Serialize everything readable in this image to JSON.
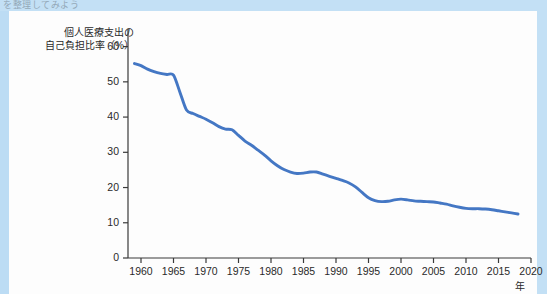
{
  "top_caption": "を整理してみよう",
  "figure": {
    "background_color": "#bcdcf4",
    "card_color": "#fdfdfd",
    "line_color": "#4477c4",
    "axis_color": "#3a3a3a",
    "text_color": "#2a2a2a"
  },
  "chart_data": {
    "type": "line",
    "title": "",
    "subtitle": "",
    "xlabel": "年",
    "ylabel": "個人医療支出の\n自己負担比率（%）",
    "ylabel_line1": "個人医療支出の",
    "ylabel_line2": "自己負担比率（%）",
    "xlim": [
      1958,
      2020
    ],
    "ylim": [
      0,
      65
    ],
    "grid": false,
    "legend": "none",
    "x_ticks": [
      1960,
      1965,
      1970,
      1975,
      1980,
      1985,
      1990,
      1995,
      2000,
      2005,
      2010,
      2015,
      2020
    ],
    "x_tick_labels": [
      "1960",
      "1965",
      "1970",
      "1975",
      "1980",
      "1985",
      "1990",
      "1995",
      "2000",
      "2005",
      "2010",
      "2015",
      "2020"
    ],
    "y_ticks": [
      0,
      10,
      20,
      30,
      40,
      50,
      60
    ],
    "y_tick_labels": [
      "0",
      "10",
      "20",
      "30",
      "40",
      "50",
      "60"
    ],
    "series": [
      {
        "name": "個人医療支出の自己負担比率",
        "color": "#4477c4",
        "x": [
          1959,
          1960,
          1961,
          1962,
          1963,
          1964,
          1965,
          1966,
          1967,
          1968,
          1969,
          1970,
          1971,
          1972,
          1973,
          1974,
          1975,
          1976,
          1977,
          1978,
          1979,
          1980,
          1981,
          1982,
          1983,
          1984,
          1985,
          1986,
          1987,
          1988,
          1989,
          1990,
          1991,
          1992,
          1993,
          1994,
          1995,
          1996,
          1997,
          1998,
          1999,
          2000,
          2001,
          2002,
          2003,
          2004,
          2005,
          2006,
          2007,
          2008,
          2009,
          2010,
          2011,
          2012,
          2013,
          2014,
          2015,
          2016,
          2017,
          2018
        ],
        "values": [
          55.2,
          54.6,
          53.6,
          52.9,
          52.4,
          52.1,
          51.9,
          47.0,
          42.0,
          41.0,
          40.2,
          39.4,
          38.4,
          37.3,
          36.6,
          36.4,
          34.8,
          33.2,
          32.0,
          30.6,
          29.2,
          27.6,
          26.2,
          25.1,
          24.4,
          24.0,
          24.1,
          24.4,
          24.4,
          23.8,
          23.2,
          22.6,
          22.0,
          21.3,
          20.2,
          18.6,
          17.1,
          16.3,
          16.0,
          16.1,
          16.5,
          16.7,
          16.5,
          16.2,
          16.1,
          16.0,
          15.9,
          15.6,
          15.3,
          14.8,
          14.4,
          14.1,
          14.0,
          14.0,
          13.9,
          13.7,
          13.4,
          13.1,
          12.8,
          12.5
        ]
      }
    ],
    "annotations": []
  }
}
